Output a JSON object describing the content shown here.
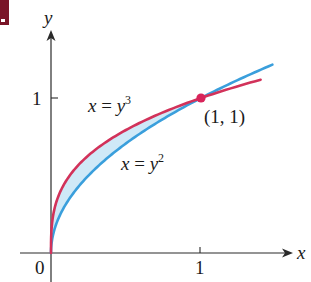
{
  "figure": {
    "corner_mark_color": "#7a1528",
    "axes": {
      "x_label": "x",
      "y_label": "y",
      "origin_label": "0",
      "x_tick_label": "1",
      "y_tick_label": "1"
    },
    "curves": [
      {
        "name": "x = y^3",
        "label_lhs": "x",
        "label_eq": " = ",
        "label_base": "y",
        "label_exp": "3",
        "color": "#d2325a"
      },
      {
        "name": "x = y^2",
        "label_lhs": "x",
        "label_eq": " = ",
        "label_base": "y",
        "label_exp": "2",
        "color": "#3a9fdc"
      }
    ],
    "intersection": {
      "label": "(1, 1)",
      "color": "#d8245a"
    },
    "region_fill": "#cfe9f7"
  },
  "chart_data": {
    "type": "line",
    "title": "",
    "xlabel": "x",
    "ylabel": "y",
    "xlim": [
      0,
      1.5
    ],
    "ylim": [
      0,
      1.25
    ],
    "x_ticks": [
      0,
      1
    ],
    "y_ticks": [
      1
    ],
    "grid": false,
    "series": [
      {
        "name": "x = y^3",
        "color": "#d2325a",
        "points": [
          [
            0,
            0
          ],
          [
            0.001,
            0.1
          ],
          [
            0.008,
            0.2
          ],
          [
            0.064,
            0.4
          ],
          [
            0.216,
            0.6
          ],
          [
            0.512,
            0.8
          ],
          [
            1,
            1
          ],
          [
            1.4,
            1.12
          ]
        ]
      },
      {
        "name": "x = y^2",
        "color": "#3a9fdc",
        "points": [
          [
            0,
            0
          ],
          [
            0.01,
            0.1
          ],
          [
            0.04,
            0.2
          ],
          [
            0.16,
            0.4
          ],
          [
            0.36,
            0.6
          ],
          [
            0.64,
            0.8
          ],
          [
            1,
            1
          ],
          [
            1.49,
            1.22
          ]
        ]
      }
    ],
    "shaded_region": "between x = y^3 and x = y^2 for 0 <= y <= 1",
    "annotations": [
      {
        "text": "(1, 1)",
        "x": 1,
        "y": 1,
        "marker": "point"
      },
      {
        "text": "x = y^3",
        "near": "upper curve"
      },
      {
        "text": "x = y^2",
        "near": "lower curve"
      }
    ]
  }
}
